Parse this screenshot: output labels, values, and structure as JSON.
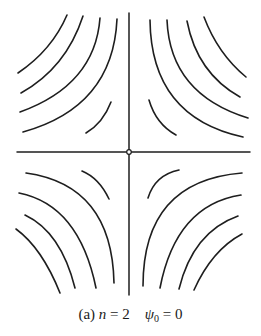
{
  "figure": {
    "stroke_color": "#1e1e1e",
    "background": "#ffffff",
    "axes": {
      "horizontal": {
        "x1": 17,
        "y1": 152,
        "x2": 250,
        "y2": 152
      },
      "vertical": {
        "x1": 129,
        "y1": 13,
        "x2": 129,
        "y2": 295
      },
      "origin": {
        "cx": 129,
        "cy": 152,
        "r": 2.3
      }
    },
    "quadrants": {
      "upper_left": [
        "M67,15 Q52,50 18,73",
        "M83,16 Q66,68 21,93",
        "M100,18 Q95,85 20,112",
        "M117,19 Q113,107 23,132",
        "M111,102 Q103,123 86,133"
      ],
      "upper_right": [
        "M150,20 Q151,117 243,137",
        "M167,20 Q170,94 248,118",
        "M187,21 Q197,73 240,97",
        "M204,17 Q218,54 246,77",
        "M149,100 Q156,124 176,135"
      ],
      "lower_left": [
        "M26,173 Q112,185 114,283",
        "M19,193 Q79,205 96,288",
        "M25,215 Q61,232 75,288",
        "M16,229 Q42,248 60,293",
        "M82,171 Q99,178 109,199"
      ],
      "lower_right": [
        "M143,286 Q143,181 242,173",
        "M160,288 Q176,205 241,195",
        "M179,289 Q193,232 238,216",
        "M194,290 Q212,250 242,234",
        "M148,198 Q155,175 179,170"
      ]
    }
  },
  "caption": {
    "label": "(a)",
    "var1": "n",
    "eq1": " = 2",
    "gap": "    ",
    "var2": "ψ",
    "var2_sub": "0",
    "eq2": " = 0"
  }
}
